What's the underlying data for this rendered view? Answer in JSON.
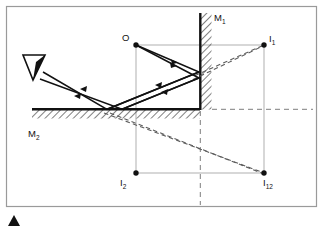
{
  "figure": {
    "kind": "optics-ray-diagram",
    "background_color": "#ffffff",
    "border_color": "#9a9a9a",
    "ink_color": "#111111",
    "construction_line_color": "#9d9d9d",
    "dashed_line_color": "#7d7d7d"
  },
  "labels": {
    "mirror_1": {
      "text": "M",
      "sub": "1",
      "x": 214,
      "y": 18
    },
    "mirror_2": {
      "text": "M",
      "sub": "2",
      "x": 31,
      "y": 135
    },
    "object": {
      "text": "O",
      "sub": "",
      "x": 122,
      "y": 39
    },
    "image_1": {
      "text": "I",
      "sub": "1",
      "x": 269,
      "y": 41
    },
    "image_2": {
      "text": "I",
      "sub": "2",
      "x": 121,
      "y": 181
    },
    "image_12": {
      "text": "I",
      "sub": "12",
      "x": 263,
      "y": 181
    }
  },
  "points": {
    "object": {
      "name": "O",
      "x": 136,
      "y": 45
    },
    "image_1": {
      "name": "I1",
      "x": 264,
      "y": 45
    },
    "image_2": {
      "name": "I2",
      "x": 136,
      "y": 173
    },
    "image_12": {
      "name": "I12",
      "x": 264,
      "y": 173
    }
  },
  "mirrors": {
    "m1": {
      "orientation": "vertical",
      "surface_x": 200,
      "top_y": 13,
      "bottom_y": 109,
      "hatch_width": 11
    },
    "m2": {
      "orientation": "horizontal",
      "surface_y": 109,
      "left_x": 32,
      "right_x": 200,
      "hatch_height": 9
    }
  },
  "axes": {
    "horizontal_dashed_y": 109,
    "horizontal_dashed_x_start": 200,
    "horizontal_dashed_x_end": 313,
    "vertical_dashed_x": 200,
    "vertical_dashed_y_start": 109,
    "vertical_dashed_y_end": 205
  },
  "eye": {
    "name": "observer-eye",
    "x": 24,
    "y": 54,
    "width": 22,
    "height": 26
  },
  "corner_marker": {
    "name": "page-corner-triangle",
    "x": 14,
    "y": 222
  },
  "rays": {
    "incident_upper": "O to M1 then reflected to M2 then to eye",
    "incident_lower": "O to M2 then reflected to M1 then to eye",
    "arrow_count": 5
  },
  "virtual_rays": {
    "to_image_1": 2,
    "to_image_12": 2
  }
}
